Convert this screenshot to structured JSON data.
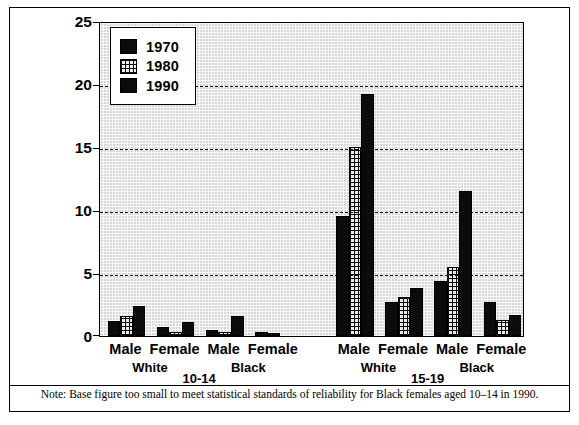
{
  "chart_data": {
    "type": "bar",
    "title": "",
    "xlabel": "",
    "ylabel": "",
    "ylim": [
      0,
      25
    ],
    "yticks": [
      0,
      5,
      10,
      15,
      20,
      25
    ],
    "grid": "horizontal dashed gridlines at 5, 10, 15, 20",
    "legend_position": "top-left inside plot",
    "categories": [
      "10-14 White Male",
      "10-14 White Female",
      "10-14 Black Male",
      "10-14 Black Female",
      "15-19 White Male",
      "15-19 White Female",
      "15-19 Black Male",
      "15-19 Black Female"
    ],
    "series": [
      {
        "name": "1970",
        "values": [
          1.2,
          0.7,
          0.5,
          0.3,
          9.5,
          2.7,
          4.4,
          2.7
        ]
      },
      {
        "name": "1980",
        "values": [
          1.6,
          0.3,
          0.3,
          0.2,
          15.0,
          3.1,
          5.5,
          1.3
        ]
      },
      {
        "name": "1990",
        "values": [
          2.4,
          1.1,
          1.6,
          0.0,
          19.2,
          3.8,
          11.5,
          1.7
        ]
      }
    ],
    "note": "Note: Base figure too small to meet statistical standards of reliability for Black females aged 10–14 in 1990."
  },
  "legend": {
    "items": [
      {
        "label": "1970",
        "pattern": "solid"
      },
      {
        "label": "1980",
        "pattern": "hatch"
      },
      {
        "label": "1990",
        "pattern": "solid"
      }
    ]
  },
  "axis": {
    "yticks": [
      "0",
      "5",
      "10",
      "15",
      "20",
      "25"
    ]
  },
  "xaxis": {
    "groups": [
      {
        "age": "10-14",
        "races": [
          {
            "race": "White",
            "sexes": [
              "Male",
              "Female"
            ]
          },
          {
            "race": "Black",
            "sexes": [
              "Male",
              "Female"
            ]
          }
        ]
      },
      {
        "age": "15-19",
        "races": [
          {
            "race": "White",
            "sexes": [
              "Male",
              "Female"
            ]
          },
          {
            "race": "Black",
            "sexes": [
              "Male",
              "Female"
            ]
          }
        ]
      }
    ],
    "sex_labels": [
      "Male",
      "Female",
      "Male",
      "Female",
      "Male",
      "Female",
      "Male",
      "Female"
    ],
    "race_labels": [
      "White",
      "Black",
      "White",
      "Black"
    ],
    "age_labels": [
      "10-14",
      "15-19"
    ]
  },
  "footnote": {
    "text": "Note: Base figure too small to meet statistical standards of reliability for Black females aged 10–14 in 1990."
  },
  "colors": {
    "bar_solid": "#0b0b0b",
    "frame": "#000000",
    "plot_background": "#d8d8d8"
  }
}
